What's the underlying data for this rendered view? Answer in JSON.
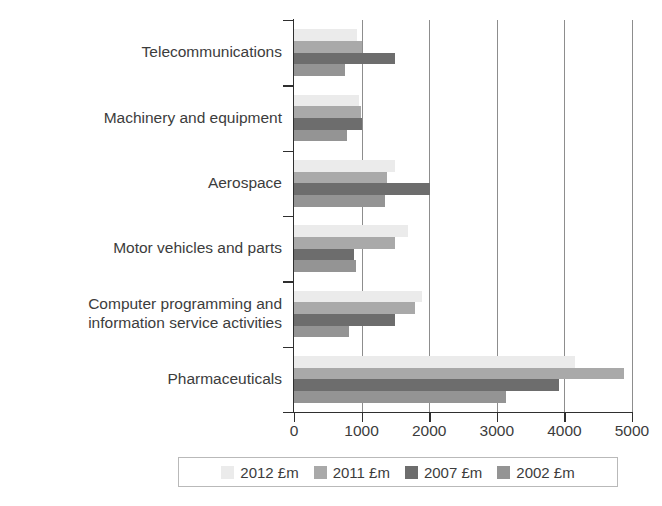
{
  "chart_data": {
    "type": "bar",
    "orientation": "horizontal",
    "title": "",
    "subtitle": "",
    "xlabel": "",
    "ylabel": "",
    "xlim": [
      0,
      5000
    ],
    "xticks": [
      0,
      1000,
      2000,
      3000,
      4000,
      5000
    ],
    "xtick_labels": [
      "0",
      "1000",
      "2000",
      "3000",
      "4000",
      "5000"
    ],
    "grid": true,
    "grid_axis": "x",
    "legend_position": "bottom",
    "categories": [
      "Telecommunications",
      "Machinery and equipment",
      "Aerospace",
      "Motor vehicles and parts",
      "Computer programming and\ninformation service activities",
      "Pharmaceuticals"
    ],
    "series": [
      {
        "name": "2012 £m",
        "color": "#ebebeb",
        "values": [
          930,
          960,
          1490,
          1680,
          1890,
          4150
        ]
      },
      {
        "name": "2011 £m",
        "color": "#a9a9a9",
        "values": [
          1000,
          990,
          1370,
          1490,
          1790,
          4880
        ]
      },
      {
        "name": "2007 £m",
        "color": "#6d6d6d",
        "values": [
          1490,
          1000,
          2010,
          890,
          1490,
          3920
        ]
      },
      {
        "name": "2002 £m",
        "color": "#949494",
        "values": [
          750,
          780,
          1350,
          910,
          810,
          3140
        ]
      }
    ]
  },
  "legend": {
    "items": [
      {
        "label": "2012 £m",
        "color": "#ebebeb"
      },
      {
        "label": "2011 £m",
        "color": "#a9a9a9"
      },
      {
        "label": "2007 £m",
        "color": "#6d6d6d"
      },
      {
        "label": "2002 £m",
        "color": "#949494"
      }
    ]
  }
}
